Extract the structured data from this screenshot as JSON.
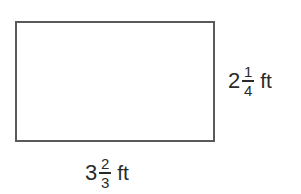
{
  "diagram": {
    "shape": "rectangle",
    "stroke_color": "#5a5a5a",
    "height_label": {
      "whole": "2",
      "numerator": "1",
      "denominator": "4",
      "unit": "ft",
      "text": "2 1/4 ft"
    },
    "width_label": {
      "whole": "3",
      "numerator": "2",
      "denominator": "3",
      "unit": "ft",
      "text": "3 2/3 ft"
    }
  }
}
